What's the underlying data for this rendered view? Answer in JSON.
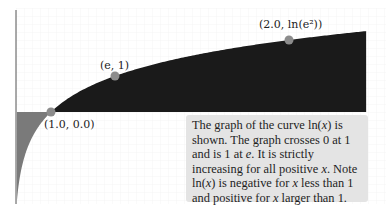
{
  "chart_data": {
    "type": "area",
    "title": "",
    "function": "ln(x)",
    "xlabel": "",
    "ylabel": "",
    "grid": true,
    "xlim": [
      0.06,
      9.46
    ],
    "ylim": [
      -2.45,
      3.1
    ],
    "x_axis_visible": false,
    "y_axis_line": true,
    "series": [
      {
        "name": "ln(x)",
        "x": [
          0.08,
          0.1,
          0.15,
          0.2,
          0.3,
          0.4,
          0.5,
          0.6,
          0.7,
          0.8,
          0.9,
          1.0,
          1.5,
          2.0,
          2.718,
          3.5,
          4.5,
          5.5,
          6.5,
          7.389,
          8.5,
          9.46
        ],
        "values": [
          -2.53,
          -2.3,
          -1.9,
          -1.61,
          -1.2,
          -0.92,
          -0.69,
          -0.51,
          -0.36,
          -0.22,
          -0.11,
          0.0,
          0.41,
          0.69,
          1.0,
          1.25,
          1.5,
          1.7,
          1.87,
          2.0,
          2.14,
          2.25
        ]
      }
    ],
    "fill": {
      "positive_color": "#1a1a1a",
      "negative_color": "#7a7a7a"
    },
    "highlighted_points": [
      {
        "label": "(1.0, 0.0)",
        "x": 1.0,
        "y": 0.0
      },
      {
        "label": "(e, 1)",
        "x": 2.718,
        "y": 1.0
      },
      {
        "label": "(2.0, ln(e²))",
        "x": 7.389,
        "y": 2.0
      }
    ],
    "point_color": "#8c8c8c",
    "annotation": "The graph of the curve ln(x) is shown. The graph crosses 0 at 1 and is 1 at e. It is strictly increasing for all positive x. Note ln(x) is negative for x less than 1 and positive for x larger than 1."
  },
  "labels": {
    "p1": "(1.0, 0.0)",
    "p2": "(e, 1)",
    "p3": "(2.0, ln(e²))"
  },
  "caption": {
    "line1a": "The graph of the curve ",
    "fn1": "ln(",
    "var1": "x",
    "fn1b": ")",
    "line1b": " is shown. The graph crosses 0 at 1 and is 1 at ",
    "e": "e",
    "line2": ". It is strictly increasing for all positive ",
    "var2": "x",
    "line3": ". Note ",
    "fn2": "ln(",
    "var3": "x",
    "fn2b": ")",
    "line4": " is negative for ",
    "var4": "x",
    "line5": " less than 1 and positive for ",
    "var5": "x",
    "line6": " larger than 1."
  }
}
